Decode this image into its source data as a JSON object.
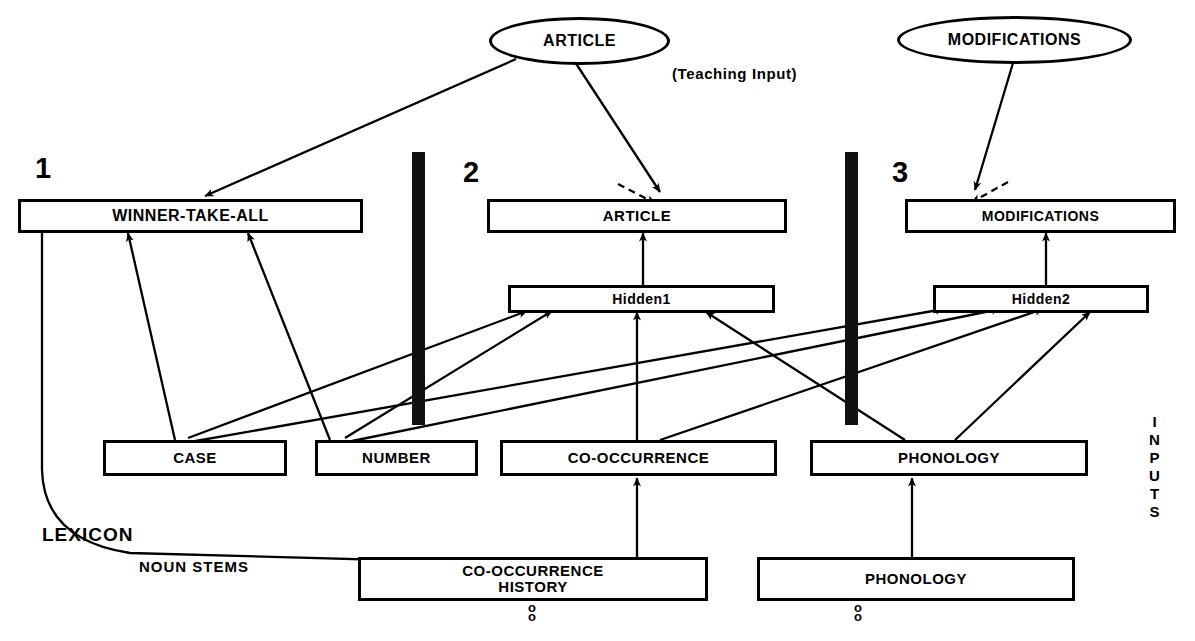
{
  "figure": {
    "title_note": "(Teaching Input)",
    "lexicon_label": "LEXICON",
    "noun_stems_label": "NOUN STEMS",
    "inputs_label": "INPUTS",
    "ellipsis_dots": "o",
    "colors": {
      "ink": "#000000",
      "paper": "#ffffff",
      "bar": "#111111"
    }
  },
  "modules": [
    {
      "number": "1",
      "output_label": "WINNER-TAKE-ALL"
    },
    {
      "number": "2",
      "output_label": "ARTICLE"
    },
    {
      "number": "3",
      "output_label": "MODIFICATIONS"
    }
  ],
  "teaching_nodes": [
    {
      "label": "ARTICLE"
    },
    {
      "label": "MODIFICATIONS"
    }
  ],
  "output_boxes": [
    {
      "label": "WINNER-TAKE-ALL"
    },
    {
      "label": "ARTICLE"
    },
    {
      "label": "MODIFICATIONS"
    }
  ],
  "hidden_boxes": [
    {
      "label": "Hidden1"
    },
    {
      "label": "Hidden2"
    }
  ],
  "input_boxes": [
    {
      "label": "CASE"
    },
    {
      "label": "NUMBER"
    },
    {
      "label": "CO-OCCURRENCE"
    },
    {
      "label": "PHONOLOGY"
    }
  ],
  "lexicon_boxes": [
    {
      "label": "CO-OCCURRENCE\nHISTORY"
    },
    {
      "label": "PHONOLOGY"
    }
  ]
}
